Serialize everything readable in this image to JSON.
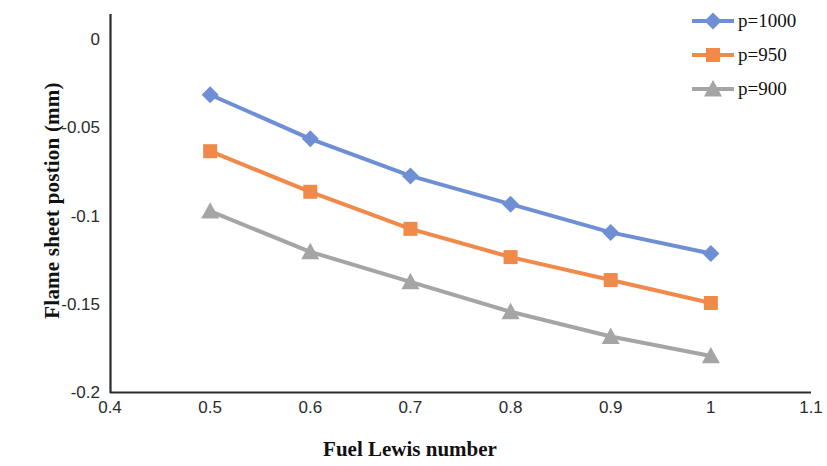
{
  "chart_data": {
    "type": "line",
    "title": "",
    "xlabel": "Fuel Lewis number",
    "ylabel": "Flame sheet postion (mm)",
    "x": [
      0.5,
      0.6,
      0.7,
      0.8,
      0.9,
      1.0
    ],
    "xlim": [
      0.4,
      1.1
    ],
    "ylim": [
      -0.2,
      0.0
    ],
    "xticks": [
      "0.4",
      "0.5",
      "0.6",
      "0.7",
      "0.8",
      "0.9",
      "1",
      "1.1"
    ],
    "xtick_values": [
      0.4,
      0.5,
      0.6,
      0.7,
      0.8,
      0.9,
      1.0,
      1.1
    ],
    "yticks": [
      "0",
      "-0.05",
      "-0.1",
      "-0.15",
      "-0.2"
    ],
    "ytick_values": [
      0,
      -0.05,
      -0.1,
      -0.15,
      -0.2
    ],
    "grid": false,
    "legend_position": "top-right",
    "series": [
      {
        "name": "p=1000",
        "color": "#6E8FD4",
        "marker": "diamond",
        "values": [
          -0.031,
          -0.056,
          -0.077,
          -0.093,
          -0.109,
          -0.121
        ]
      },
      {
        "name": "p=950",
        "color": "#F1894A",
        "marker": "square",
        "values": [
          -0.063,
          -0.086,
          -0.107,
          -0.123,
          -0.136,
          -0.149
        ]
      },
      {
        "name": "p=900",
        "color": "#A5A5A5",
        "marker": "triangle",
        "values": [
          -0.097,
          -0.12,
          -0.137,
          -0.154,
          -0.168,
          -0.179
        ]
      }
    ]
  },
  "legend": {
    "items": [
      {
        "label": "p=1000",
        "color": "#6E8FD4",
        "marker": "diamond"
      },
      {
        "label": "p=950",
        "color": "#F1894A",
        "marker": "square"
      },
      {
        "label": "p=900",
        "color": "#A5A5A5",
        "marker": "triangle"
      }
    ]
  },
  "axes": {
    "x_title": "Fuel Lewis number",
    "y_title": "Flame sheet postion (mm)",
    "axis_color": "#2b2b2b"
  }
}
